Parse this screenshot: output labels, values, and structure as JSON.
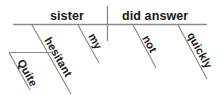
{
  "diagram": {
    "type": "reed-kellogg-sentence-diagram",
    "sentence": "Quite hesitant, my sister did not answer quickly.",
    "colors": {
      "background": "#ffffff",
      "line": "#8a8a8a",
      "text": "#1a1a1a"
    },
    "baseline": {
      "label": "main-horizontal-baseline",
      "x1": 13,
      "y1": 24.5,
      "x2": 207,
      "y2": 24.5
    },
    "divider": {
      "label": "subject-predicate-divider",
      "x": 107.5,
      "y1": 6,
      "y2": 41
    },
    "words": {
      "subject": {
        "text": "sister",
        "role": "subject",
        "x": 50,
        "y": 20
      },
      "predicate": {
        "text": "did answer",
        "role": "verb-phrase",
        "x": 122,
        "y": 20
      },
      "subject_modifier_1": {
        "text": "hesitant",
        "role": "adjective",
        "slant_x1": 32,
        "slant_y1": 25,
        "slant_x2": 71,
        "slant_y2": 94,
        "text_x": 44,
        "text_y": 40,
        "rotate": 60
      },
      "subject_modifier_2": {
        "text": "my",
        "role": "possessive-adjective",
        "slant_x1": 78,
        "slant_y1": 25,
        "slant_x2": 99,
        "slant_y2": 63,
        "text_x": 88,
        "text_y": 36,
        "rotate": 61
      },
      "adverb_of_modifier": {
        "text": "Quite",
        "role": "adverb",
        "slant_x1": 9,
        "slant_y1": 52.5,
        "slant_x2": 30,
        "slant_y2": 90,
        "text_x": 17,
        "text_y": 62,
        "rotate": 61
      },
      "verb_modifier_1": {
        "text": "not",
        "role": "adverb",
        "slant_x1": 133,
        "slant_y1": 25,
        "slant_x2": 156,
        "slant_y2": 68,
        "text_x": 142,
        "text_y": 38,
        "rotate": 61
      },
      "verb_modifier_2": {
        "text": "quickly",
        "role": "adverb",
        "slant_x1": 178,
        "slant_y1": 25,
        "slant_x2": 207,
        "slant_y2": 79,
        "text_x": 187,
        "text_y": 35,
        "rotate": 61
      }
    },
    "connectors": {
      "adverb_support_line": {
        "label": "quite-support-horizontal",
        "x1": 9,
        "y1": 52.5,
        "x2": 51,
        "y2": 52.5
      }
    }
  }
}
